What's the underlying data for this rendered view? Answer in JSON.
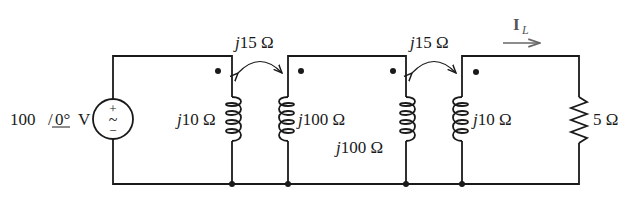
{
  "source": {
    "magnitude": "100",
    "angle": "0°",
    "unit": "V",
    "plus": "+",
    "minus": "−",
    "symbol": "~"
  },
  "coils": [
    {
      "label_j": "j",
      "label_val": "10 Ω"
    },
    {
      "label_j": "j",
      "label_val": "100 Ω"
    },
    {
      "label_j": "j",
      "label_val": "100 Ω"
    },
    {
      "label_j": "j",
      "label_val": "10 Ω"
    }
  ],
  "mutual": [
    {
      "label_j": "j",
      "label_val": "15 Ω"
    },
    {
      "label_j": "j",
      "label_val": "15 Ω"
    }
  ],
  "load": {
    "label": "5 Ω"
  },
  "current": {
    "symbol": "I",
    "subscript": "L"
  }
}
